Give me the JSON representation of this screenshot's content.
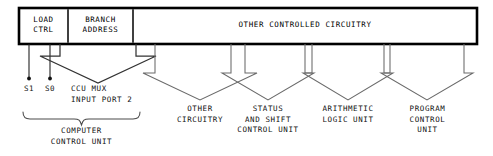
{
  "diagram": {
    "colors": {
      "background": "#ffffff",
      "stroke": "#000000",
      "arrow_stroke": "#5a5a5a",
      "text": "#111111"
    },
    "main_box": {
      "sections": [
        {
          "id": "load-ctrl",
          "label": "LOAD\nCTRL"
        },
        {
          "id": "branch-address",
          "label": "BRANCH\nADDRESS"
        },
        {
          "id": "other-controlled-circuitry",
          "label": "OTHER CONTROLLED CIRCUITRY"
        }
      ]
    },
    "signals": [
      {
        "id": "s1",
        "label": "S1"
      },
      {
        "id": "s0",
        "label": "S0"
      }
    ],
    "mux": {
      "label": "CCU MUX\n  INPUT PORT 2"
    },
    "brace_label": "COMPUTER\nCONTROL UNIT",
    "units": [
      {
        "id": "other-circuitry",
        "label": "OTHER\nCIRCUITRY"
      },
      {
        "id": "status-and-shift-control-unit",
        "label": "STATUS\nAND SHIFT\nCONTROL UNIT"
      },
      {
        "id": "arithmetic-logic-unit",
        "label": "ARITHMETIC\nLOGIC UNIT"
      },
      {
        "id": "program-control-unit",
        "label": "PROGRAM\nCONTROL\nUNIT"
      }
    ]
  }
}
